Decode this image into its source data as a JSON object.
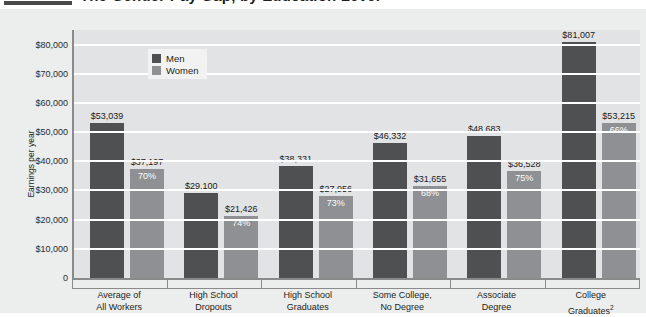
{
  "title": {
    "text": "The Gender Pay Gap, by Education Level",
    "rule_color": "#4a4a4a"
  },
  "legend": {
    "men_label": "Men",
    "women_label": "Women",
    "men_color": "#4f5052",
    "women_color": "#8e9093"
  },
  "axis": {
    "ylabel": "Earnings per year",
    "yticks": [
      "0",
      "$10,000",
      "$20,000",
      "$30,000",
      "$40,000",
      "$50,000",
      "$60,000",
      "$70,000",
      "$80,000"
    ]
  },
  "chart_data": {
    "type": "bar",
    "title": "The Gender Pay Gap, by Education Level",
    "xlabel": "",
    "ylabel": "Earnings per year",
    "ylim": [
      0,
      85000
    ],
    "ytick_step": 10000,
    "grid": true,
    "legend_position": "top-left-inside",
    "categories": [
      "Average of\nAll Workers",
      "High School\nDropouts",
      "High School\nGraduates",
      "Some College,\nNo Degree",
      "Associate\nDegree",
      "College\nGraduates"
    ],
    "series": [
      {
        "name": "Men",
        "color": "#4f5052",
        "values": [
          53039,
          29100,
          38331,
          46332,
          48683,
          81007
        ],
        "labels": [
          "$53,039",
          "$29,100",
          "$38,331",
          "$46,332",
          "$48,683",
          "$81,007"
        ]
      },
      {
        "name": "Women",
        "color": "#8e9093",
        "values": [
          37197,
          21426,
          27956,
          31655,
          36528,
          53215
        ],
        "labels": [
          "$37,197",
          "$21,426",
          "$27,956",
          "$31,655",
          "$36,528",
          "$53,215"
        ],
        "ratio_labels": [
          "70%",
          "74%",
          "73%",
          "68%",
          "75%",
          "66%"
        ]
      }
    ]
  },
  "categories": [
    {
      "line1": "Average of",
      "line2": "All Workers",
      "footnote": ""
    },
    {
      "line1": "High School",
      "line2": "Dropouts",
      "footnote": ""
    },
    {
      "line1": "High School",
      "line2": "Graduates",
      "footnote": ""
    },
    {
      "line1": "Some College,",
      "line2": "No Degree",
      "footnote": ""
    },
    {
      "line1": "Associate",
      "line2": "Degree",
      "footnote": ""
    },
    {
      "line1": "College",
      "line2": "Graduates",
      "footnote": "2"
    }
  ]
}
